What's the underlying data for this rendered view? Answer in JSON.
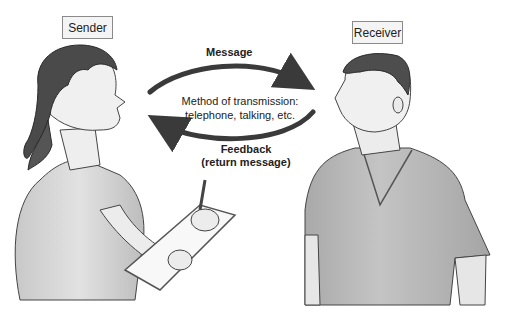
{
  "diagram": {
    "sender": {
      "label": "Sender"
    },
    "receiver": {
      "label": "Receiver"
    },
    "message_arrow": {
      "label": "Message",
      "direction": "sender-to-receiver"
    },
    "transmission": {
      "line1": "Method of transmission:",
      "line2": "telephone, talking, etc."
    },
    "feedback_arrow": {
      "line1": "Feedback",
      "line2": "(return message)",
      "direction": "receiver-to-sender"
    },
    "colors": {
      "arrow": "#3a3a3a",
      "figure_shirt": "#b8b8b8",
      "figure_skin": "#e8e8e8",
      "hair": "#4a4a4a",
      "box_border": "#8a8a8a",
      "box_fill": "#f4f4f4"
    }
  }
}
